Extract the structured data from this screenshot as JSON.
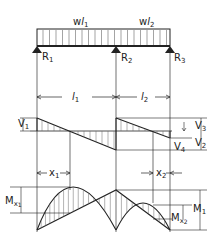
{
  "diagram": {
    "colors": {
      "ink": "#222222",
      "background": "#ffffff",
      "hatch": "#555555"
    },
    "load_labels": [
      {
        "main": "w",
        "italic": "l",
        "sub": "1"
      },
      {
        "main": "w",
        "italic": "l",
        "sub": "2"
      }
    ],
    "reactions": [
      {
        "main": "R",
        "sub": "1"
      },
      {
        "main": "R",
        "sub": "2"
      },
      {
        "main": "R",
        "sub": "3"
      }
    ],
    "spans": [
      {
        "main": "l",
        "sub": "1"
      },
      {
        "main": "l",
        "sub": "2"
      }
    ],
    "shear_labels": [
      {
        "main": "V",
        "sub": "1"
      },
      {
        "main": "V",
        "sub": "2"
      },
      {
        "main": "V",
        "sub": "3"
      },
      {
        "main": "V",
        "sub": "4"
      }
    ],
    "distance_labels": [
      {
        "main": "x",
        "sub": "1"
      },
      {
        "main": "x",
        "sub": "2"
      }
    ],
    "moment_labels": [
      {
        "main": "M",
        "sub": "x",
        "subsub": "1"
      },
      {
        "main": "M",
        "sub": "x",
        "subsub": "2"
      },
      {
        "main": "M",
        "sub": "1"
      }
    ]
  }
}
